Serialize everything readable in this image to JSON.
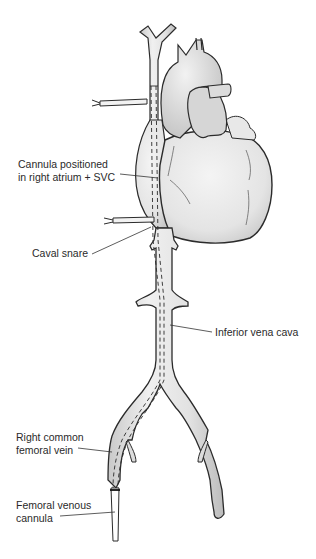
{
  "figure": {
    "labels": {
      "cannula_ra_svc": {
        "line1": "Cannula positioned",
        "line2": "in right atrium + SVC"
      },
      "caval_snare": "Caval snare",
      "ivc": "Inferior vena cava",
      "right_femoral_vein": {
        "line1": "Right common",
        "line2": "femoral vein"
      },
      "femoral_cannula": {
        "line1": "Femoral venous",
        "line2": "cannula"
      }
    },
    "colors": {
      "outline": "#2b2b2b",
      "vessel_fill": "#e6e6e6",
      "heart_fill": "#ececec",
      "shadow": "#bdbdbd",
      "text": "#2a2a2a",
      "background": "#ffffff"
    }
  }
}
